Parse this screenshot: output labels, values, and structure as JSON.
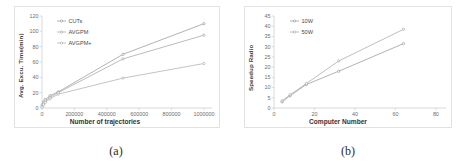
{
  "figure": {
    "panels": [
      {
        "caption": "(a)",
        "chart_data": {
          "type": "line",
          "title": "",
          "xlabel": "Number of trajectories",
          "ylabel": "Avg. Excu. Time(min)",
          "xlim": [
            0,
            1050000
          ],
          "ylim": [
            0,
            120
          ],
          "xticks": [
            "0",
            "200000",
            "400000",
            "600000",
            "800000",
            "1000000"
          ],
          "xtickvalues": [
            0,
            200000,
            400000,
            600000,
            800000,
            1000000
          ],
          "yticks": [
            "0",
            "20",
            "40",
            "60",
            "80",
            "100",
            "120"
          ],
          "ytickvalues": [
            0,
            20,
            40,
            60,
            80,
            100,
            120
          ],
          "grid": false,
          "legend_position": "upper-left",
          "x": [
            1000,
            10000,
            20000,
            50000,
            100000,
            500000,
            1000000
          ],
          "series": [
            {
              "name": "CUTs",
              "color": "#9a9a9a",
              "values": [
                4,
                8,
                11,
                16,
                21,
                70,
                110
              ]
            },
            {
              "name": "AVGPM",
              "color": "#a5a5a5",
              "values": [
                2,
                6,
                9,
                14,
                20,
                64,
                95
              ]
            },
            {
              "name": "AVGPM+",
              "color": "#b0b0b0",
              "values": [
                1,
                4,
                7,
                12,
                18,
                39,
                58
              ]
            }
          ]
        }
      },
      {
        "caption": "(b)",
        "chart_data": {
          "type": "line",
          "title": "",
          "xlabel": "Computer Number",
          "ylabel": "Speedup Radio",
          "xlim": [
            0,
            85
          ],
          "ylim": [
            0,
            45
          ],
          "xticks": [
            "0",
            "20",
            "40",
            "60",
            "80"
          ],
          "xtickvalues": [
            0,
            20,
            40,
            60,
            80
          ],
          "yticks": [
            "0",
            "5",
            "10",
            "15",
            "20",
            "25",
            "30",
            "35",
            "40",
            "45"
          ],
          "ytickvalues": [
            0,
            5,
            10,
            15,
            20,
            25,
            30,
            35,
            40,
            45
          ],
          "grid": false,
          "legend_position": "upper-left",
          "x": [
            4,
            8,
            16,
            32,
            64
          ],
          "series": [
            {
              "name": "10W",
              "color": "#9a9a9a",
              "values": [
                3.0,
                6.0,
                11.5,
                18.0,
                31.5
              ]
            },
            {
              "name": "50W",
              "color": "#a8a8a8",
              "values": [
                3.5,
                6.5,
                12.0,
                23.0,
                38.5
              ]
            }
          ]
        }
      }
    ]
  }
}
